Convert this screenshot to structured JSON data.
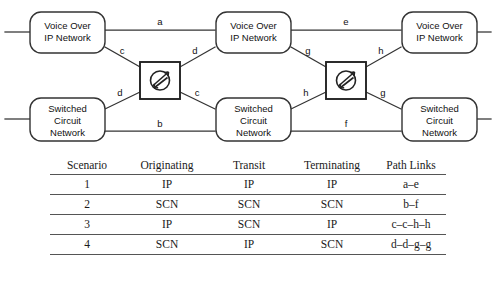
{
  "diagram": {
    "type": "network-topology",
    "stroke_color": "#333333",
    "nodes": [
      {
        "id": "vo-ip-left",
        "label_line1": "Voice Over",
        "label_line2": "IP Network",
        "kind": "network-box",
        "column": "left",
        "row": "top"
      },
      {
        "id": "scn-left",
        "label_line1": "Switched",
        "label_line2": "Circuit",
        "label_line3": "Network",
        "kind": "network-box",
        "column": "left",
        "row": "bottom"
      },
      {
        "id": "vo-ip-mid",
        "label_line1": "Voice Over",
        "label_line2": "IP Network",
        "kind": "network-box",
        "column": "middle",
        "row": "top"
      },
      {
        "id": "scn-mid",
        "label_line1": "Switched",
        "label_line2": "Circuit",
        "label_line3": "Network",
        "kind": "network-box",
        "column": "middle",
        "row": "bottom"
      },
      {
        "id": "vo-ip-right",
        "label_line1": "Voice Over",
        "label_line2": "IP Network",
        "kind": "network-box",
        "column": "right",
        "row": "top"
      },
      {
        "id": "scn-right",
        "label_line1": "Switched",
        "label_line2": "Circuit",
        "label_line3": "Network",
        "kind": "network-box",
        "column": "right",
        "row": "bottom"
      },
      {
        "id": "gateway-1",
        "kind": "gateway-router",
        "icon": "router-icon"
      },
      {
        "id": "gateway-2",
        "kind": "gateway-router",
        "icon": "router-icon"
      }
    ],
    "link_labels": [
      {
        "id": "a",
        "text": "a"
      },
      {
        "id": "b",
        "text": "b"
      },
      {
        "id": "c1",
        "text": "c"
      },
      {
        "id": "d1",
        "text": "d"
      },
      {
        "id": "d2",
        "text": "d"
      },
      {
        "id": "c2",
        "text": "c"
      },
      {
        "id": "e",
        "text": "e"
      },
      {
        "id": "f",
        "text": "f"
      },
      {
        "id": "g1",
        "text": "g"
      },
      {
        "id": "h1",
        "text": "h"
      },
      {
        "id": "h2",
        "text": "h"
      },
      {
        "id": "g2",
        "text": "g"
      }
    ]
  },
  "table": {
    "headers": [
      "Scenario",
      "Originating",
      "Transit",
      "Terminating",
      "Path Links"
    ],
    "rows": [
      {
        "scenario": "1",
        "originating": "IP",
        "transit": "IP",
        "terminating": "IP",
        "path_links": "a–e"
      },
      {
        "scenario": "2",
        "originating": "SCN",
        "transit": "SCN",
        "terminating": "SCN",
        "path_links": "b–f"
      },
      {
        "scenario": "3",
        "originating": "IP",
        "transit": "SCN",
        "terminating": "IP",
        "path_links": "c–c–h–h"
      },
      {
        "scenario": "4",
        "originating": "SCN",
        "transit": "IP",
        "terminating": "SCN",
        "path_links": "d–d–g–g"
      }
    ]
  }
}
